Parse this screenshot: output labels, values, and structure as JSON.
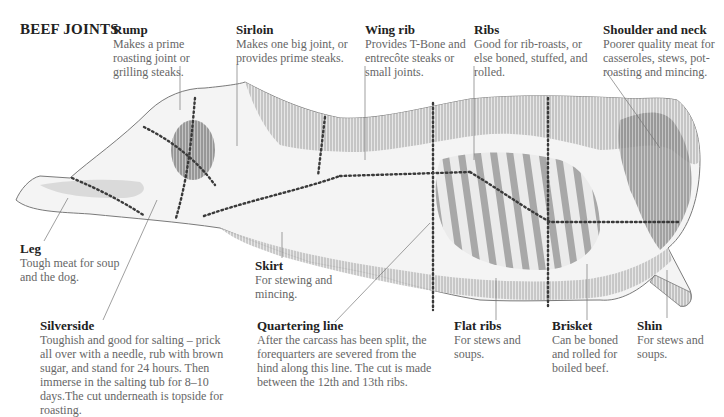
{
  "title": "BEEF JOINTS",
  "colors": {
    "heading": "#222222",
    "body": "#666666",
    "leader": "#777777",
    "cut_line": "#3a3a3a",
    "shading": "#8a8a8a"
  },
  "joints": [
    {
      "id": "rump",
      "name": "Rump",
      "desc": "Makes a prime roasting joint or grilling steaks."
    },
    {
      "id": "sirloin",
      "name": "Sirloin",
      "desc": "Makes one big joint, or provides prime steaks."
    },
    {
      "id": "wing-rib",
      "name": "Wing rib",
      "desc": "Provides T-Bone and entrecôte steaks or small joints."
    },
    {
      "id": "ribs",
      "name": "Ribs",
      "desc": "Good for rib-roasts, or else boned, stuffed, and rolled."
    },
    {
      "id": "shoulder-neck",
      "name": "Shoulder and neck",
      "desc": "Poorer quality meat for casseroles, stews, pot-roasting and mincing."
    },
    {
      "id": "leg",
      "name": "Leg",
      "desc": "Tough meat for soup and the dog."
    },
    {
      "id": "skirt",
      "name": "Skirt",
      "desc": "For stewing and mincing."
    },
    {
      "id": "silverside",
      "name": "Silverside",
      "desc": "Toughish and good for salting – prick all over with a needle, rub with brown sugar, and stand for 24 hours. Then immerse in the salting tub for 8–10 days.The cut underneath is topside for roasting."
    },
    {
      "id": "quartering-line",
      "name": "Quartering line",
      "desc": "After the carcass has been split, the forequarters are severed from the hind along this line. The cut is made between the 12th and 13th ribs."
    },
    {
      "id": "flat-ribs",
      "name": "Flat ribs",
      "desc": "For stews and soups."
    },
    {
      "id": "brisket",
      "name": "Brisket",
      "desc": "Can be boned and rolled for boiled beef."
    },
    {
      "id": "shin",
      "name": "Shin",
      "desc": "For stews and soups."
    }
  ]
}
